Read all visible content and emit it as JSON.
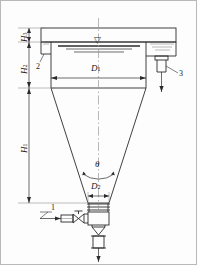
{
  "diagram": {
    "type": "engineering-schematic",
    "line_color": "#2b2b2b",
    "thin_line_color": "#6e6e6e",
    "background": "#fdfdfd"
  },
  "dimensions": {
    "h1": {
      "label": "H",
      "sub": "1",
      "orientation": "vertical",
      "describes": "cone section height"
    },
    "h2": {
      "label": "H",
      "sub": "2",
      "orientation": "vertical",
      "describes": "cylindrical shell height"
    },
    "h3": {
      "label": "H",
      "sub": "3",
      "orientation": "vertical",
      "describes": "freeboard / lid height"
    },
    "d1": {
      "label": "D",
      "sub": "1",
      "orientation": "horizontal",
      "describes": "tank inside diameter"
    },
    "d2": {
      "label": "D",
      "sub": "2",
      "orientation": "horizontal",
      "describes": "cone outlet diameter"
    },
    "theta": {
      "label": "θ",
      "sub": "",
      "orientation": "arc",
      "describes": "cone apex angle"
    }
  },
  "callouts": [
    {
      "id": "1",
      "label": "1",
      "describes": "inlet line to valve"
    },
    {
      "id": "2",
      "label": "2",
      "describes": "upper shell corner detail"
    },
    {
      "id": "3",
      "label": "3",
      "describes": "overflow nozzle"
    }
  ],
  "symbols": {
    "liquid_level": "▽",
    "liquid_level_name": "liquid-level-symbol"
  }
}
